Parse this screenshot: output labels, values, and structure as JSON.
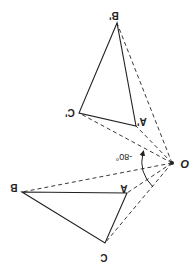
{
  "diagram": {
    "type": "rotation",
    "colors": {
      "stroke": "#222222",
      "background": "#ffffff"
    },
    "center": {
      "label": "O",
      "x": 172,
      "y": 163
    },
    "angle_label": "-80°",
    "original": {
      "A": {
        "label": "A",
        "x": 127,
        "y": 193
      },
      "B": {
        "label": "B",
        "x": 22,
        "y": 192
      },
      "C": {
        "label": "C",
        "x": 105,
        "y": 243
      }
    },
    "image": {
      "A": {
        "label": "A'",
        "x": 136,
        "y": 126
      },
      "B": {
        "label": "B'",
        "x": 117,
        "y": 23
      },
      "C": {
        "label": "C'",
        "x": 79,
        "y": 113
      }
    }
  }
}
